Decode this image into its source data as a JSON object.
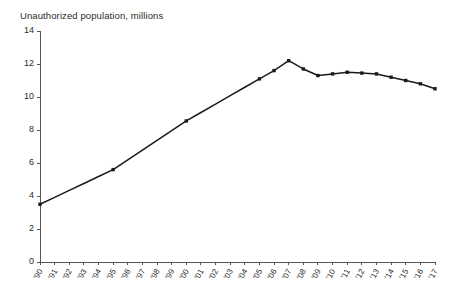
{
  "chart_data": {
    "type": "line",
    "title": "Unauthorized population, millions",
    "xlabel": "",
    "ylabel": "",
    "ylim": [
      0,
      14
    ],
    "yticks": [
      0,
      2,
      4,
      6,
      8,
      10,
      12,
      14
    ],
    "ytick_labels": [
      "0",
      "2",
      "4",
      "6",
      "8",
      "10",
      "12",
      "14"
    ],
    "grid": false,
    "legend": "none",
    "marker": "square",
    "line_color": "#1a1a1a",
    "categories": [
      "'90",
      "'91",
      "'92",
      "'93",
      "'94",
      "'95",
      "'96",
      "'97",
      "'98",
      "'99",
      "'00",
      "'01",
      "'02",
      "'03",
      "'04",
      "'05",
      "'06",
      "'07",
      "'08",
      "'09",
      "'10",
      "'11",
      "'12",
      "'13",
      "'14",
      "'15",
      "'16",
      "'17"
    ],
    "x": [
      1990,
      1991,
      1992,
      1993,
      1994,
      1995,
      1996,
      1997,
      1998,
      1999,
      2000,
      2001,
      2002,
      2003,
      2004,
      2005,
      2006,
      2007,
      2008,
      2009,
      2010,
      2011,
      2012,
      2013,
      2014,
      2015,
      2016,
      2017
    ],
    "values": [
      3.5,
      3.92,
      4.34,
      4.76,
      5.18,
      5.6,
      6.19,
      6.78,
      7.37,
      7.96,
      8.55,
      9.06,
      9.57,
      10.08,
      10.59,
      11.1,
      11.6,
      12.2,
      11.7,
      11.3,
      11.4,
      11.5,
      11.45,
      11.4,
      11.2,
      11.0,
      10.8,
      10.5
    ],
    "marked_points": [
      "'90",
      "'95",
      "'00",
      "'05",
      "'06",
      "'07",
      "'08",
      "'09",
      "'10",
      "'11",
      "'12",
      "'13",
      "'14",
      "'15",
      "'16",
      "'17"
    ]
  }
}
